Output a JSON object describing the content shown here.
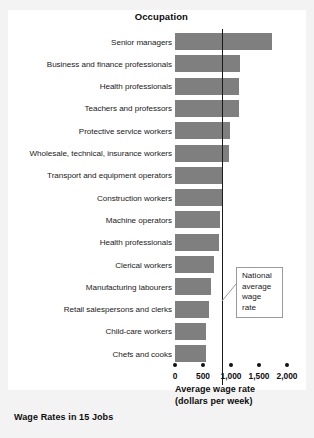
{
  "figure": {
    "chart_title": "Occupation",
    "caption": "Wage Rates in 15 Jobs",
    "axis_title_line1": "Average wage rate",
    "axis_title_line2": "(dollars per week)",
    "callout_line1": "National",
    "callout_line2": "average",
    "callout_line3": "wage rate",
    "bar_color": "#7f7f7f",
    "line_color": "#1a1a1a",
    "panel_color": "#ffffff",
    "background_color": "#f3f3f3"
  },
  "chart_data": {
    "type": "bar",
    "orientation": "horizontal",
    "title": "Occupation",
    "xlabel": "Average wage rate (dollars per week)",
    "ylabel": "Occupation",
    "xlim": [
      0,
      2000
    ],
    "xticks": [
      0,
      500,
      1000,
      1500,
      2000
    ],
    "xticklabels": [
      "0",
      "500",
      "1,000",
      "1,500",
      "2,000"
    ],
    "grid": false,
    "legend": null,
    "categories": [
      "Senior managers",
      "Business and finance professionals",
      "Health professionals",
      "Teachers and professors",
      "Protective service workers",
      "Wholesale, technical, insurance workers",
      "Transport and equipment operators",
      "Construction workers",
      "Machine operators",
      "Health professionals",
      "Clerical workers",
      "Manufacturing labourers",
      "Retail salespersons and clerks",
      "Child-care workers",
      "Chefs and cooks"
    ],
    "values": [
      1730,
      1160,
      1145,
      1140,
      980,
      965,
      845,
      840,
      800,
      790,
      700,
      645,
      610,
      555,
      550
    ],
    "annotations": [
      {
        "name": "national-average-wage-rate",
        "text": "National average wage rate",
        "type": "vertical-reference-line",
        "value": 840
      }
    ]
  }
}
